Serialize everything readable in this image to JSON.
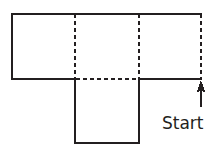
{
  "figure": {
    "annotation": {
      "label": "Start",
      "arrow_icon": "up-arrow-icon",
      "arrow_direction": "up"
    },
    "colors": {
      "stroke": "#231f20",
      "text": "#231f20",
      "background": "#ffffff"
    },
    "stroke_width": 1.6,
    "dash_pattern": "4,3",
    "geometry": {
      "top_row": {
        "x1": 12,
        "y1": 14,
        "x2": 201,
        "y2": 79
      },
      "bottom_square": {
        "x1": 75,
        "y1": 79,
        "x2": 139,
        "y2": 143
      },
      "vertical_divider_1_x": 75,
      "vertical_divider_2_x": 139,
      "midline_y": 79,
      "arrow": {
        "x": 201,
        "y_tail": 106,
        "y_head": 81
      }
    },
    "edges": [
      {
        "name": "top-edge",
        "style": "solid",
        "x1": 12,
        "y1": 14,
        "x2": 201,
        "y2": 14
      },
      {
        "name": "left-edge",
        "style": "solid",
        "x1": 12,
        "y1": 14,
        "x2": 12,
        "y2": 79
      },
      {
        "name": "midline-left-segment",
        "style": "solid",
        "x1": 12,
        "y1": 79,
        "x2": 75,
        "y2": 79
      },
      {
        "name": "midline-center-segment",
        "style": "dashed",
        "x1": 75,
        "y1": 79,
        "x2": 139,
        "y2": 79
      },
      {
        "name": "midline-right-segment",
        "style": "solid",
        "x1": 139,
        "y1": 79,
        "x2": 201,
        "y2": 79
      },
      {
        "name": "right-edge",
        "style": "dashed",
        "x1": 201,
        "y1": 14,
        "x2": 201,
        "y2": 79
      },
      {
        "name": "divider-1",
        "style": "dashed",
        "x1": 75,
        "y1": 14,
        "x2": 75,
        "y2": 79
      },
      {
        "name": "divider-2",
        "style": "dashed",
        "x1": 139,
        "y1": 14,
        "x2": 139,
        "y2": 79
      },
      {
        "name": "bottom-square-left-edge",
        "style": "solid",
        "x1": 75,
        "y1": 79,
        "x2": 75,
        "y2": 143
      },
      {
        "name": "bottom-square-right-edge",
        "style": "solid",
        "x1": 139,
        "y1": 79,
        "x2": 139,
        "y2": 143
      },
      {
        "name": "bottom-square-bottom-edge",
        "style": "solid",
        "x1": 75,
        "y1": 143,
        "x2": 139,
        "y2": 143
      }
    ]
  }
}
